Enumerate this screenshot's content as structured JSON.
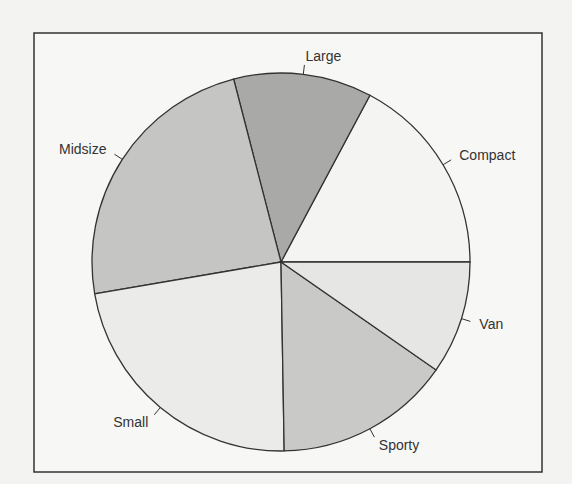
{
  "chart_data": {
    "type": "pie",
    "title": "",
    "slices": [
      {
        "label": "Compact",
        "value": 16,
        "color": "#f4f4f2"
      },
      {
        "label": "Large",
        "value": 11,
        "color": "#a9a9a7"
      },
      {
        "label": "Midsize",
        "value": 22,
        "color": "#c5c5c3"
      },
      {
        "label": "Small",
        "value": 21,
        "color": "#ebebe9"
      },
      {
        "label": "Sporty",
        "value": 14,
        "color": "#c9c9c7"
      },
      {
        "label": "Van",
        "value": 9,
        "color": "#e6e6e4"
      }
    ],
    "start_angle_deg": 0,
    "direction": "counterclockwise",
    "frame": true,
    "legend": "none"
  },
  "layout": {
    "frame": {
      "x": 34,
      "y": 33,
      "w": 508,
      "h": 439
    },
    "center": {
      "x": 281,
      "y": 262
    },
    "radius": 189
  }
}
